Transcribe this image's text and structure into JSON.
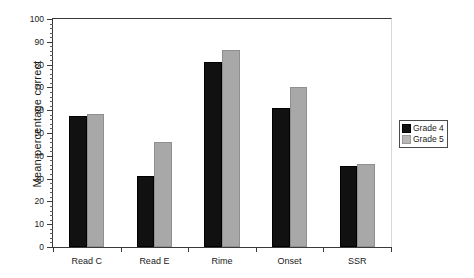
{
  "chart_data": {
    "type": "bar",
    "title": "",
    "xlabel": "",
    "ylabel": "Mean percentage correct",
    "ylim": [
      0,
      100
    ],
    "ytick_step": 10,
    "yminor_step": 2,
    "grid": false,
    "legend_position": "right",
    "categories": [
      "Read C",
      "Read E",
      "Rime",
      "Onset",
      "SSR"
    ],
    "ytick_labels": [
      "0",
      "10",
      "20",
      "30",
      "40",
      "50",
      "60",
      "70",
      "80",
      "90",
      "100"
    ],
    "series": [
      {
        "name": "Grade 4",
        "color": "#111111",
        "values": [
          57.5,
          31,
          81,
          61,
          35.5
        ]
      },
      {
        "name": "Grade 5",
        "color": "#a8a8a8",
        "values": [
          58.5,
          46,
          86.5,
          70,
          36.5
        ]
      }
    ]
  },
  "legend": {
    "items": [
      {
        "label": "Grade 4"
      },
      {
        "label": "Grade 5"
      }
    ]
  }
}
